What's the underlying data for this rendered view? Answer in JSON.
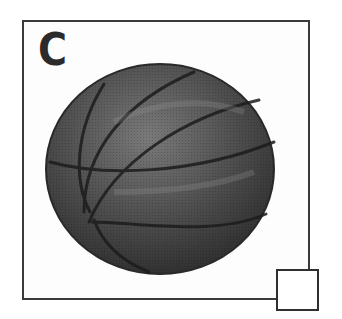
{
  "option": {
    "letter": "C",
    "image": "basketball",
    "selected": false
  },
  "colors": {
    "frame": "#3a3a3a",
    "ball_dark": "#2a2a2a",
    "ball_mid": "#5a5a5a",
    "ball_light": "#8a8a8a",
    "seam": "#1a1a1a"
  }
}
